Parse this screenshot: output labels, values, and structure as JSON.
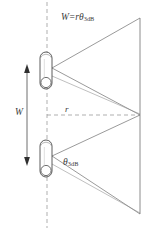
{
  "figure": {
    "background_color": "#ffffff",
    "line_color": "#6e6e6e",
    "text_color": "#3b3b3b",
    "width": 155,
    "height": 230
  },
  "labels": {
    "beam_width_equation": {
      "symbol_w": "W",
      "operator_equals": "=",
      "symbol_r": "r",
      "symbol_theta": "θ",
      "subscript": "3dB",
      "full_text": "W = rθ₃ᴅʙ"
    },
    "beamwidth_angle": {
      "symbol_theta": "θ",
      "subscript": "3dB",
      "full_text": "θ₃ᴅʙ"
    },
    "range": {
      "symbol": "r",
      "full_text": "r"
    },
    "cross_range_width": {
      "symbol": "W",
      "full_text": "W"
    }
  },
  "elements": {
    "antenna_top": {
      "name": "antenna-element-top",
      "shape": "capsule",
      "x": 40,
      "y": 52,
      "width": 12,
      "height": 37
    },
    "antenna_bottom": {
      "name": "antenna-element-bottom",
      "shape": "capsule",
      "x": 40,
      "y": 140,
      "width": 12,
      "height": 37
    },
    "boresight_axis": {
      "name": "vertical-dashed-axis",
      "style": "dashed",
      "x": 47,
      "y1": 2,
      "y2": 228
    },
    "range_axis": {
      "name": "horizontal-dashed-range-axis",
      "style": "dashed",
      "x1": 47,
      "x2": 140,
      "y": 115
    },
    "separation_arrow": {
      "name": "width-double-arrow",
      "x": 27,
      "y1": 66,
      "y2": 164
    },
    "target_plane": {
      "name": "far-field-plane-line",
      "x": 140,
      "y1": 18,
      "y2": 214
    },
    "convergence_point": {
      "name": "beam-convergence-point",
      "x": 140,
      "y": 115
    }
  }
}
